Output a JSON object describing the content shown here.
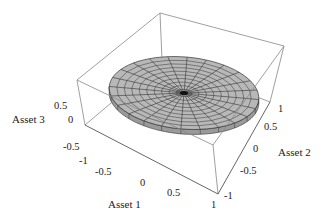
{
  "chart_data": {
    "type": "surface3d",
    "title": "",
    "axes": {
      "x": {
        "label": "Asset 1",
        "ticks": [
          "-1",
          "-0.5",
          "0",
          "0.5",
          "1"
        ],
        "range": [
          -1,
          1
        ]
      },
      "y": {
        "label": "Asset 2",
        "ticks": [
          "-1",
          "-0.5",
          "0",
          "0.5",
          "1"
        ],
        "range": [
          -1,
          1
        ]
      },
      "z": {
        "label": "Asset 3",
        "ticks": [
          "-0.5",
          "0",
          "0.5"
        ],
        "range": [
          -0.5,
          0.5
        ]
      }
    },
    "surface": {
      "shape": "disk",
      "radius": 1,
      "z": 0,
      "radial_lines": 24,
      "rings": 10,
      "fill": "#b8b8b8",
      "mesh_color": "#333333"
    },
    "box": true,
    "grid": false,
    "legend": null
  },
  "labels": {
    "x_axis": "Asset 1",
    "y_axis": "Asset 2",
    "z_axis": "Asset 3"
  },
  "ticks": {
    "x": [
      "-1",
      "-0.5",
      "0",
      "0.5",
      "1"
    ],
    "y": [
      "-1",
      "-0.5",
      "0",
      "0.5",
      "1"
    ],
    "z": [
      "0.5",
      "0",
      "-0.5"
    ]
  }
}
